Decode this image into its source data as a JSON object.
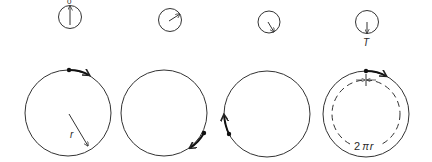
{
  "diagram": {
    "colors": {
      "stroke": "#333333",
      "background": "#ffffff"
    },
    "clocks": [
      {
        "id": "clock-1",
        "hand_angle_deg": 0,
        "label": "0"
      },
      {
        "id": "clock-2",
        "hand_angle_deg": 60,
        "label": ""
      },
      {
        "id": "clock-3",
        "hand_angle_deg": 150,
        "label": ""
      },
      {
        "id": "clock-4",
        "hand_angle_deg": 180,
        "label": "T"
      }
    ],
    "circles": [
      {
        "id": "circle-1",
        "point_position": "top",
        "motion": "clockwise",
        "radius_label": "r"
      },
      {
        "id": "circle-2",
        "point_position": "lower-right",
        "motion": "clockwise"
      },
      {
        "id": "circle-3",
        "point_position": "lower-left",
        "motion": "clockwise"
      },
      {
        "id": "circle-4",
        "point_position": "top",
        "motion": "clockwise",
        "circumference_label": "2πr",
        "dashed_inner": true
      }
    ],
    "labels": {
      "time_start": "0",
      "time_end": "T",
      "radius": "r",
      "circumference": "2πr",
      "circumference_num": "2",
      "circumference_pi": "π",
      "circumference_r": "r"
    }
  }
}
